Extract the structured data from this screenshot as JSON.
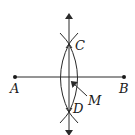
{
  "diagram": {
    "points": {
      "A": {
        "label": "A",
        "x": 15,
        "y": 77
      },
      "B": {
        "label": "B",
        "x": 124,
        "y": 77
      },
      "C": {
        "label": "C",
        "x": 69,
        "y": 44
      },
      "D": {
        "label": "D",
        "x": 69,
        "y": 112
      }
    },
    "labels": {
      "A": "A",
      "B": "B",
      "C": "C",
      "D": "D",
      "M": "M"
    },
    "colors": {
      "stroke": "#2a2a2a",
      "background": "#ffffff"
    }
  }
}
